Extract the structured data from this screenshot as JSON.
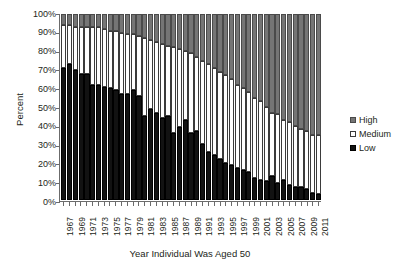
{
  "chart_data": {
    "type": "bar",
    "subtype": "stacked-100-percent",
    "title": "",
    "xlabel": "Year Individual Was Aged 50",
    "ylabel": "Percent",
    "ylim": [
      0,
      100
    ],
    "ytick_labels": [
      "100%",
      "90%",
      "80%",
      "70%",
      "60%",
      "50%",
      "40%",
      "30%",
      "20%",
      "10%",
      "0%"
    ],
    "ytick_values": [
      100,
      90,
      80,
      70,
      60,
      50,
      40,
      30,
      20,
      10,
      0
    ],
    "grid": false,
    "legend_position": "right",
    "categories": [
      "1967",
      "1968",
      "1969",
      "1970",
      "1971",
      "1972",
      "1973",
      "1974",
      "1975",
      "1976",
      "1977",
      "1978",
      "1979",
      "1980",
      "1981",
      "1982",
      "1983",
      "1984",
      "1985",
      "1986",
      "1987",
      "1988",
      "1989",
      "1990",
      "1991",
      "1992",
      "1993",
      "1994",
      "1995",
      "1996",
      "1997",
      "1998",
      "1999",
      "2000",
      "2001",
      "2002",
      "2003",
      "2004",
      "2005",
      "2006",
      "2007",
      "2008",
      "2009",
      "2010",
      "2011"
    ],
    "xtick_labels": [
      "1967",
      "1969",
      "1971",
      "1973",
      "1975",
      "1977",
      "1979",
      "1981",
      "1983",
      "1985",
      "1987",
      "1989",
      "1991",
      "1993",
      "1995",
      "1997",
      "1999",
      "2001",
      "2003",
      "2005",
      "2007",
      "2009",
      "2011"
    ],
    "series": [
      {
        "name": "Low",
        "color": "#121212",
        "values": [
          71,
          73,
          70,
          68,
          68,
          62,
          62,
          61,
          60,
          59,
          57,
          57,
          59,
          56,
          45,
          49,
          47,
          44,
          45,
          36,
          39,
          43,
          36,
          37,
          30,
          26,
          24,
          22,
          20,
          19,
          17,
          16,
          15,
          12,
          11,
          10,
          13,
          9,
          11,
          8,
          7,
          7,
          6,
          4,
          3
        ]
      },
      {
        "name": "Medium",
        "color": "#ffffff",
        "values": [
          23,
          21,
          23,
          25,
          25,
          31,
          31,
          31,
          31,
          32,
          33,
          32,
          30,
          32,
          42,
          37,
          38,
          40,
          38,
          46,
          42,
          37,
          43,
          40,
          45,
          47,
          47,
          47,
          47,
          46,
          45,
          44,
          43,
          43,
          42,
          40,
          34,
          37,
          32,
          34,
          33,
          31,
          31,
          31,
          32
        ]
      },
      {
        "name": "High",
        "color": "#757575",
        "values": [
          6,
          6,
          7,
          7,
          7,
          7,
          7,
          8,
          9,
          9,
          10,
          11,
          11,
          12,
          13,
          14,
          15,
          16,
          17,
          18,
          19,
          20,
          21,
          23,
          25,
          27,
          29,
          31,
          33,
          35,
          38,
          40,
          42,
          45,
          47,
          50,
          53,
          54,
          57,
          58,
          60,
          62,
          63,
          65,
          65
        ]
      }
    ]
  },
  "legend": {
    "items": [
      {
        "label": "High",
        "key": "high"
      },
      {
        "label": "Medium",
        "key": "medium"
      },
      {
        "label": "Low",
        "key": "low"
      }
    ]
  }
}
